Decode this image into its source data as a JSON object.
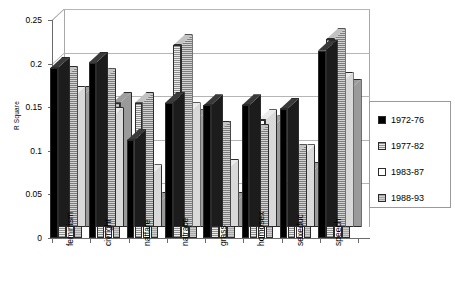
{
  "chart_data": {
    "type": "bar",
    "title": "",
    "xlabel": "",
    "ylabel": "R Square",
    "ylim": [
      0,
      0.25
    ],
    "yticks": [
      "0",
      "0.05",
      "0.1",
      "0.15",
      "0.2",
      "0.25"
    ],
    "ytick_values": [
      0,
      0.05,
      0.1,
      0.15,
      0.2,
      0.25
    ],
    "grid": true,
    "legend_position": "right",
    "style": "3d-clustered-column",
    "categories": [
      "feminism",
      "civright",
      "natfare",
      "natrace",
      "grass",
      "homosex",
      "sexeduc",
      "speech"
    ],
    "series": [
      {
        "name": "1972-76",
        "fill": "solid-black",
        "color": "#000000",
        "values": [
          0.195,
          0.201,
          0.112,
          0.155,
          0.152,
          0.152,
          0.148,
          0.215
        ]
      },
      {
        "name": "1977-82",
        "fill": "horizontal-stripe-gray",
        "color": "#d8d8d8",
        "values": [
          0.185,
          0.182,
          0.155,
          0.221,
          0.122,
          0.118,
          0.095,
          0.228
        ]
      },
      {
        "name": "1983-87",
        "fill": "white",
        "color": "#ffffff",
        "values": [
          0.162,
          0.138,
          0.072,
          0.143,
          0.078,
          0.135,
          0.095,
          0.178
        ]
      },
      {
        "name": "1988-93",
        "fill": "solid-gray",
        "color": "#bdbdbd",
        "values": [
          0.162,
          0.155,
          0.04,
          0.135,
          0.04,
          0.128,
          0.075,
          0.17
        ]
      }
    ]
  },
  "legend": {
    "items": [
      {
        "label": "1972-76"
      },
      {
        "label": "1977-82"
      },
      {
        "label": "1983-87"
      },
      {
        "label": "1988-93"
      }
    ]
  }
}
